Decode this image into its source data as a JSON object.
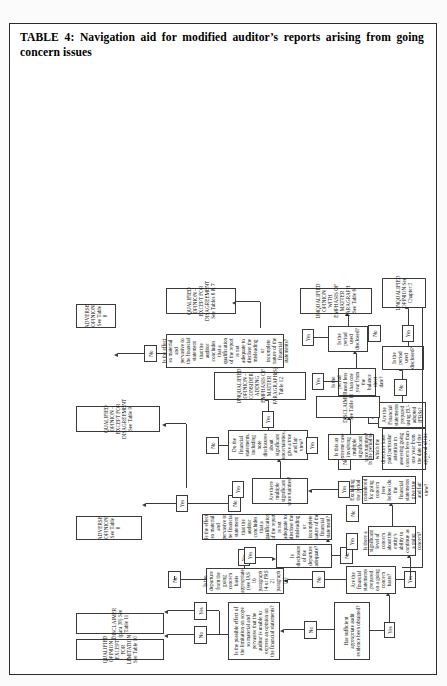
{
  "document": {
    "title": "TABLE 4: Navigation aid for modified auditor’s reports arising from going concern issues"
  },
  "flowchart": {
    "type": "decision-flowchart",
    "orientation": "landscape-rotated-90ccw",
    "decisions": [
      {
        "id": "d1",
        "text": "Has sufficient appropriate audit evidence been obtained?"
      },
      {
        "id": "d2",
        "text": "Is the possible effect of the limitation on scope so material and pervasive that the auditor is unable to express an opinion on the financial statements?"
      },
      {
        "id": "d3",
        "text": "Are the financial statements prepared on a going concern basis?"
      },
      {
        "id": "d4",
        "text": "Is the departure from the going concern basis appropriate (see IAS 10 paragraph 14 or FRS 21 paragraph 14)"
      },
      {
        "id": "d5",
        "text": "Is disclosure of the departure adequate?"
      },
      {
        "id": "d6",
        "text": "Is the effect so material and pervasive to the financial statement that the auditor concludes that a qualification of the report is not adequate to disclose the misleading or incomplete nature of the financial statement?"
      },
      {
        "id": "d7",
        "text": "Is there a significant level of concern about the entity’s ability to continue as a going concern?"
      },
      {
        "id": "d8",
        "text": "Excluding the period considered for going concern (see below) do the financial statements give true and fair view?"
      },
      {
        "id": "d9",
        "text": "Are there multiple significant uncertainties?"
      },
      {
        "id": "d10",
        "text": "Do the financial statements, including note disclosures about significant uncertainties, give a true and fair view?"
      },
      {
        "id": "d11",
        "text": "Is this an extreme case involving multiple significant uncertainties?"
      },
      {
        "id": "d12",
        "text": "Is the period to which the directors have paid particular attention in assessing going concern less than one year from the date of the approval of the financial statements?"
      },
      {
        "id": "d13",
        "text": "Are the Financial statements prepared using EU-adopted IFRSs?"
      },
      {
        "id": "d14",
        "text": "Is the period used less than one year from the balance sheet date?"
      },
      {
        "id": "d15",
        "text": "Is the period used disclosed?"
      },
      {
        "id": "d16",
        "text": "Is the period used disclosed?"
      },
      {
        "id": "d17",
        "text": "Is the effect so material and pervasive to the financial statement that the auditor concludes that a qualification of the report is not adequate to disclose the misleading or incomplete nature of the financial statements?"
      }
    ],
    "terminals": [
      {
        "id": "t1",
        "text": "QUALIFIED OPINION – EXCEPT FOR LIMITATION See Table 10"
      },
      {
        "id": "t2",
        "text": "DISCLAIMER (para 38) See Table 11"
      },
      {
        "id": "t3",
        "text": "ADVERSE OPINION See Table 8"
      },
      {
        "id": "t4",
        "text": "QUALIFIED OPINION – EXCEPT FOR DISAGREEMENT See Table 9"
      },
      {
        "id": "t5",
        "text": "ADVERSE OPINION See Table 8"
      },
      {
        "id": "t6",
        "text": "DISCLAIMER See Table 10"
      },
      {
        "id": "t7",
        "text": "UNQUALIFIED OPINION – CONSIDER ADDING EMPHASIS OF MATTER PARAGRAPH(S) Table 12"
      },
      {
        "id": "t8",
        "text": "UNQUALIFIED OPINION WITH EMPHASIS OF MATTER PARAGRAPH See Table 6"
      },
      {
        "id": "t9",
        "text": "QUALIFIED OPINION – EXCEPT FOR DISAGREEMENT See Tables 6 & 7"
      },
      {
        "id": "t10",
        "text": "UNQUALIFIED OPINION See Chapter 3"
      }
    ],
    "edge_labels": {
      "yes": "Yes",
      "no": "No"
    }
  }
}
